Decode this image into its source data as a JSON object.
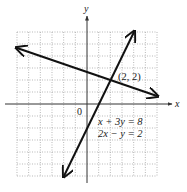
{
  "chart_data": {
    "type": "line",
    "title": "",
    "xlabel": "x",
    "ylabel": "y",
    "origin_label": "0",
    "xlim": [
      -6,
      6
    ],
    "ylim": [
      -6,
      6
    ],
    "grid": true,
    "series": [
      {
        "name": "x + 3y = 8",
        "equation": "x + 3y = 8",
        "points": [
          [
            -6,
            4.67
          ],
          [
            6,
            0.67
          ]
        ]
      },
      {
        "name": "2x - y = 2",
        "equation": "2x − y = 2",
        "points": [
          [
            -2,
            -6
          ],
          [
            4,
            6
          ]
        ]
      }
    ],
    "annotations": [
      {
        "text": "(2, 2)",
        "x": 2,
        "y": 2
      }
    ],
    "legend": [
      "x + 3y = 8",
      "2x − y = 2"
    ]
  },
  "labels": {
    "x_axis": "x",
    "y_axis": "y",
    "origin": "0",
    "point": "(2, 2)",
    "eq1": "x + 3y = 8",
    "eq2": "2x − y = 2"
  }
}
